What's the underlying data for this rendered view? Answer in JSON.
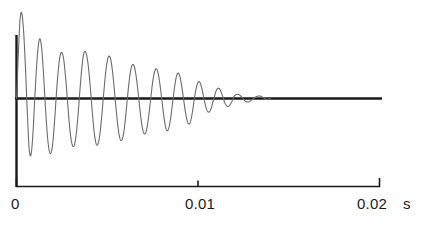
{
  "figure": {
    "name": "damped-oscillation-waveform",
    "background_color": "#ffffff",
    "axis_color": "#1a1a1a",
    "curve_color": "#6b6b6b"
  },
  "axis": {
    "unit_label": "s",
    "ticks": [
      {
        "value": 0,
        "label": "0"
      },
      {
        "value": 0.01,
        "label": "0.01"
      },
      {
        "value": 0.02,
        "label": "0.02"
      }
    ]
  },
  "chart_data": {
    "type": "line",
    "title": "",
    "subtitle": "",
    "xlabel": "s",
    "ylabel": "",
    "xlim": [
      0,
      0.02
    ],
    "ylim": [
      -1.05,
      1.05
    ],
    "grid": false,
    "legend": null,
    "annotations": [],
    "xticks": [
      0,
      0.01,
      0.02
    ],
    "xticklabels": [
      "0",
      "0.01",
      "0.02"
    ],
    "yticks": [],
    "yticklabels": [],
    "series": [
      {
        "name": "damped oscillation",
        "color": "#6b6b6b",
        "x": [
          0.0,
          0.0001,
          0.0002,
          0.0003,
          0.0004,
          0.0005,
          0.0006,
          0.0007,
          0.0008,
          0.0009,
          0.001,
          0.0011,
          0.0012,
          0.0013,
          0.0014,
          0.0015,
          0.0016,
          0.0017,
          0.0018,
          0.0019,
          0.002,
          0.0021,
          0.0022,
          0.0023,
          0.0024,
          0.0025,
          0.0026,
          0.0027,
          0.0028,
          0.0029,
          0.003,
          0.0031,
          0.0032,
          0.0033,
          0.0034,
          0.0035,
          0.0036,
          0.0037,
          0.0038,
          0.0039,
          0.004,
          0.0041,
          0.0042,
          0.0043,
          0.0044,
          0.0045,
          0.0046,
          0.0047,
          0.0048,
          0.0049,
          0.005,
          0.0051,
          0.0052,
          0.0053,
          0.0054,
          0.0055,
          0.0056,
          0.0057,
          0.0058,
          0.0059,
          0.006,
          0.0061,
          0.0062,
          0.0063,
          0.0064,
          0.0065,
          0.0066,
          0.0067,
          0.0068,
          0.0069,
          0.007,
          0.0071,
          0.0072,
          0.0073,
          0.0074,
          0.0075,
          0.0076,
          0.0077,
          0.0078,
          0.0079,
          0.008,
          0.0081,
          0.0082,
          0.0083,
          0.0084,
          0.0085,
          0.0086,
          0.0087,
          0.0088,
          0.0089,
          0.009,
          0.0091,
          0.0092,
          0.0093,
          0.0094,
          0.0095,
          0.0096,
          0.0097,
          0.0098,
          0.0099,
          0.01,
          0.0101,
          0.0102,
          0.0103,
          0.0104,
          0.0105,
          0.0106,
          0.0107,
          0.0108,
          0.0109,
          0.011,
          0.0111,
          0.0112,
          0.0113,
          0.0114,
          0.0115,
          0.0116,
          0.0117,
          0.0118,
          0.0119,
          0.012,
          0.0122,
          0.0124,
          0.0126,
          0.0128,
          0.013,
          0.0132,
          0.0134,
          0.0136,
          0.0138,
          0.014
        ],
        "y": [
          0.0,
          0.52,
          0.94,
          0.995,
          0.76,
          0.33,
          -0.18,
          -0.6,
          -0.66,
          -0.43,
          -0.03,
          0.35,
          0.62,
          0.7,
          0.56,
          0.25,
          -0.12,
          -0.43,
          -0.61,
          -0.64,
          -0.52,
          -0.26,
          0.06,
          0.33,
          0.5,
          0.54,
          0.46,
          0.26,
          0.0,
          -0.27,
          -0.47,
          -0.56,
          -0.54,
          -0.4,
          -0.17,
          0.11,
          0.36,
          0.52,
          0.55,
          0.47,
          0.29,
          0.04,
          -0.22,
          -0.43,
          -0.54,
          -0.53,
          -0.41,
          -0.2,
          0.05,
          0.28,
          0.44,
          0.5,
          0.45,
          0.3,
          0.08,
          -0.15,
          -0.35,
          -0.47,
          -0.49,
          -0.41,
          -0.24,
          -0.02,
          0.19,
          0.34,
          0.4,
          0.37,
          0.25,
          0.07,
          -0.13,
          -0.3,
          -0.4,
          -0.41,
          -0.33,
          -0.18,
          0.01,
          0.19,
          0.31,
          0.35,
          0.3,
          0.17,
          0.0,
          -0.18,
          -0.32,
          -0.38,
          -0.34,
          -0.22,
          -0.05,
          0.12,
          0.25,
          0.3,
          0.26,
          0.15,
          0.0,
          -0.15,
          -0.26,
          -0.3,
          -0.26,
          -0.15,
          0.0,
          0.12,
          0.19,
          0.19,
          0.13,
          0.03,
          -0.07,
          -0.14,
          -0.16,
          -0.13,
          -0.06,
          0.02,
          0.09,
          0.12,
          0.11,
          0.06,
          0.0,
          -0.06,
          -0.09,
          -0.09,
          -0.06,
          -0.02,
          0.03,
          0.05,
          0.02,
          -0.03,
          -0.04,
          -0.01,
          0.02,
          0.03,
          0.01,
          -0.01,
          0.0
        ]
      }
    ]
  }
}
